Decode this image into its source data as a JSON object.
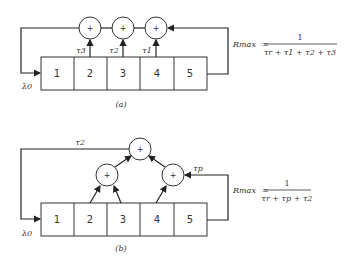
{
  "diagram_a": {
    "caption": "(a)",
    "cells": [
      "1",
      "2",
      "3",
      "4",
      "5"
    ],
    "input_label": "λ0",
    "adders": [
      "+",
      "+",
      "+"
    ],
    "tap_labels": [
      "τ3",
      "τ2",
      "τ1"
    ],
    "formula": {
      "lhs": "Rmax",
      "numerator": "1",
      "denominator": "τr + τ1 + τ2 + τ3"
    }
  },
  "diagram_b": {
    "caption": "(b)",
    "cells": [
      "1",
      "2",
      "3",
      "4",
      "5"
    ],
    "input_label": "λ0",
    "adders": [
      "+",
      "+",
      "+"
    ],
    "feedback_label": "τ2",
    "tap_label": "τp",
    "formula": {
      "lhs": "Rmax",
      "numerator": "1",
      "denominator": "τr + τp + τ2"
    }
  }
}
